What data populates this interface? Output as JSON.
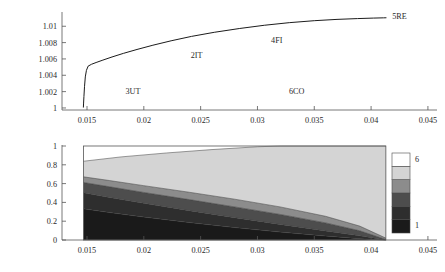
{
  "figure": {
    "title": "",
    "panels": [
      "top-line-plot",
      "bottom-contour-plot"
    ]
  },
  "chart_data": [
    {
      "type": "line",
      "id": "top-line-plot",
      "title": "",
      "xlabel": "",
      "ylabel": "",
      "xlim": [
        0.0128,
        0.0458
      ],
      "ylim": [
        0.99975,
        1.0115
      ],
      "grid": false,
      "legend": "none",
      "xticks": [
        0.015,
        0.02,
        0.025,
        0.03,
        0.035,
        0.04,
        0.045
      ],
      "xtick_labels": [
        "0.015",
        "0.02",
        "0.025",
        "0.03",
        "0.035",
        "0.04",
        "0.045"
      ],
      "yticks": [
        1,
        1.002,
        1.004,
        1.006,
        1.008,
        1.01
      ],
      "ytick_labels": [
        "1",
        "1.002",
        "1.004",
        "1.006",
        "1.008",
        "1.01"
      ],
      "series": [
        {
          "name": "curve",
          "x": [
            0.01468,
            0.0147,
            0.01473,
            0.01478,
            0.01485,
            0.01495,
            0.0151,
            0.0154,
            0.0158,
            0.0164,
            0.0172,
            0.0182,
            0.0194,
            0.0208,
            0.0224,
            0.0242,
            0.0262,
            0.0284,
            0.0306,
            0.0328,
            0.035,
            0.037,
            0.0388,
            0.0402,
            0.0411,
            0.04135
          ],
          "y": [
            1.00005,
            1.0006,
            1.0014,
            1.0026,
            1.0038,
            1.0046,
            1.00512,
            1.00535,
            1.00556,
            1.00586,
            1.00624,
            1.00668,
            1.00716,
            1.00768,
            1.00822,
            1.00876,
            1.00926,
            1.00972,
            1.01012,
            1.01044,
            1.01068,
            1.01084,
            1.01094,
            1.011,
            1.01103,
            1.01104
          ]
        }
      ],
      "annotations": [
        {
          "text": "3UT",
          "x": 0.01905,
          "y": 1.0017
        },
        {
          "text": "2IT",
          "x": 0.02465,
          "y": 1.00615
        },
        {
          "text": "4FI",
          "x": 0.0317,
          "y": 1.008
        },
        {
          "text": "5RE",
          "x": 0.0425,
          "y": 1.0109
        },
        {
          "text": "6CO",
          "x": 0.03345,
          "y": 1.00175
        }
      ]
    },
    {
      "type": "area",
      "id": "bottom-contour-plot",
      "title": "",
      "xlabel": "",
      "ylabel": "",
      "xlim": [
        0.0128,
        0.0458
      ],
      "ylim": [
        0,
        1
      ],
      "grid": false,
      "legend": "colorbar-right",
      "xticks": [
        0.015,
        0.02,
        0.025,
        0.03,
        0.035,
        0.04,
        0.045
      ],
      "xtick_labels": [
        "0.015",
        "0.02",
        "0.025",
        "0.03",
        "0.035",
        "0.04",
        "0.045"
      ],
      "yticks": [
        0,
        0.2,
        0.4,
        0.6,
        0.8,
        1
      ],
      "ytick_labels": [
        "0",
        "0.2",
        "0.4",
        "0.6",
        "0.8",
        "1"
      ],
      "x_domain": [
        0.0147,
        0.0413
      ],
      "boundaries": [
        {
          "name": "top-of-band-5",
          "x": [
            0.0147,
            0.018,
            0.022,
            0.026,
            0.03,
            0.03205,
            0.0321,
            0.0413
          ],
          "y": [
            0.838,
            0.884,
            0.926,
            0.962,
            0.992,
            1.0,
            1.0,
            1.0
          ]
        },
        {
          "name": "top-of-band-4",
          "x": [
            0.0147,
            0.017,
            0.02,
            0.024,
            0.028,
            0.032,
            0.036,
            0.039,
            0.0413
          ],
          "y": [
            0.672,
            0.632,
            0.578,
            0.508,
            0.434,
            0.352,
            0.252,
            0.148,
            0.02
          ]
        },
        {
          "name": "top-of-band-3",
          "x": [
            0.0147,
            0.017,
            0.02,
            0.024,
            0.028,
            0.032,
            0.036,
            0.039,
            0.0413
          ],
          "y": [
            0.612,
            0.566,
            0.506,
            0.43,
            0.352,
            0.272,
            0.182,
            0.098,
            0.006
          ]
        },
        {
          "name": "top-of-band-2",
          "x": [
            0.0147,
            0.017,
            0.02,
            0.024,
            0.028,
            0.032,
            0.036,
            0.039,
            0.0413
          ],
          "y": [
            0.502,
            0.452,
            0.39,
            0.312,
            0.238,
            0.166,
            0.096,
            0.044,
            0.0
          ]
        },
        {
          "name": "top-of-band-1",
          "x": [
            0.0147,
            0.017,
            0.02,
            0.024,
            0.028,
            0.032,
            0.036,
            0.039,
            0.0413
          ],
          "y": [
            0.332,
            0.292,
            0.244,
            0.186,
            0.132,
            0.084,
            0.042,
            0.014,
            0.0
          ]
        }
      ],
      "band_colors": [
        "#1a1a1a",
        "#2e2e2e",
        "#4d4d4d",
        "#8c8c8c",
        "#d4d4d4",
        "#ffffff"
      ]
    }
  ],
  "colorbar": {
    "name": "level-colorbar",
    "levels": [
      1,
      2,
      3,
      4,
      5,
      6
    ],
    "top_label": "6",
    "bottom_label": "1",
    "colors": [
      "#1a1a1a",
      "#2e2e2e",
      "#4d4d4d",
      "#8c8c8c",
      "#d4d4d4",
      "#ffffff"
    ]
  }
}
